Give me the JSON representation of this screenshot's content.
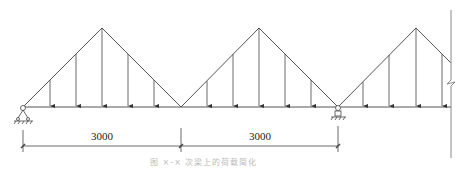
{
  "diagram": {
    "type": "beam-load-diagram",
    "colors": {
      "line": "#555555",
      "arrow": "#333333",
      "wall": "#999999",
      "caption": "#bbbbbb"
    },
    "beam": {
      "y": 107,
      "x_start": 23,
      "x_end": 451
    },
    "load_peaks": [
      {
        "x": 102,
        "y": 28
      },
      {
        "x": 259,
        "y": 28
      },
      {
        "x": 416,
        "y": 28
      }
    ],
    "load_valleys": [
      {
        "x": 23,
        "y": 107
      },
      {
        "x": 181,
        "y": 107
      },
      {
        "x": 338,
        "y": 107
      }
    ],
    "supports": [
      {
        "type": "pin",
        "x": 23,
        "y": 107
      },
      {
        "type": "roller",
        "x": 338,
        "y": 107
      }
    ],
    "wall": {
      "x": 451,
      "y_top": 10,
      "y_bottom": 158,
      "break_y": 82
    },
    "dimensions": [
      {
        "label": "3000",
        "x1": 23,
        "x2": 181,
        "y": 146
      },
      {
        "label": "3000",
        "x1": 181,
        "x2": 338,
        "y": 146
      }
    ],
    "caption": "图 ×-× 次梁上的荷载简化"
  }
}
